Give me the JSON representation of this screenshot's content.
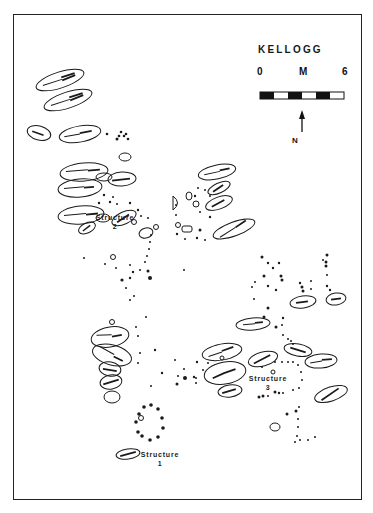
{
  "map": {
    "title": "KELLOGG",
    "scale": {
      "start": "0",
      "unit": "M",
      "end": "6",
      "segments": 6
    },
    "north_label": "N",
    "structures": [
      {
        "name": "Structure",
        "number": "2"
      },
      {
        "name": "Structure",
        "number": "3"
      },
      {
        "name": "Structure",
        "number": "1"
      }
    ],
    "colors": {
      "ink": "#1a1a1a",
      "paper": "#ffffff"
    }
  }
}
